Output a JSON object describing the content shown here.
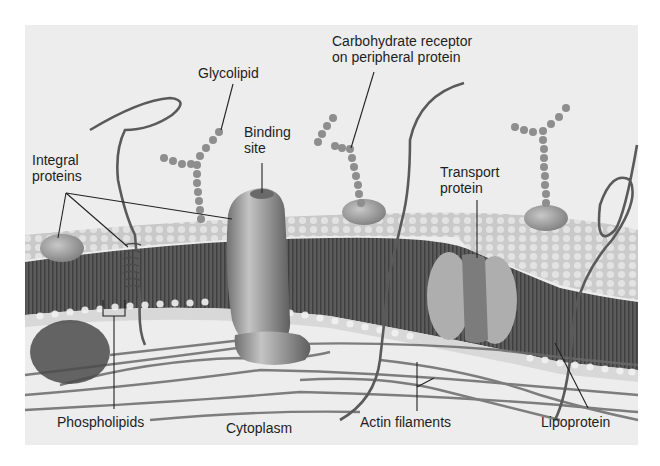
{
  "figure": {
    "labels": {
      "glycolipid": "Glycolipid",
      "carbohydrate_receptor_line1": "Carbohydrate receptor",
      "carbohydrate_receptor_line2": "on peripheral protein",
      "binding_site_line1": "Binding",
      "binding_site_line2": "site",
      "integral_proteins_line1": "Integral",
      "integral_proteins_line2": "proteins",
      "transport_protein_line1": "Transport",
      "transport_protein_line2": "protein",
      "phospholipids": "Phospholipids",
      "cytoplasm": "Cytoplasm",
      "actin_filaments": "Actin filaments",
      "lipoprotein": "Lipoprotein"
    },
    "colors": {
      "background": "#efefef",
      "membrane_core": "#5a5a5a",
      "lipid_heads": "#d6d6d6",
      "protein": "#8c8c8c",
      "transport_protein": "#a8a8a8",
      "label_text": "#1e1e1e"
    }
  }
}
